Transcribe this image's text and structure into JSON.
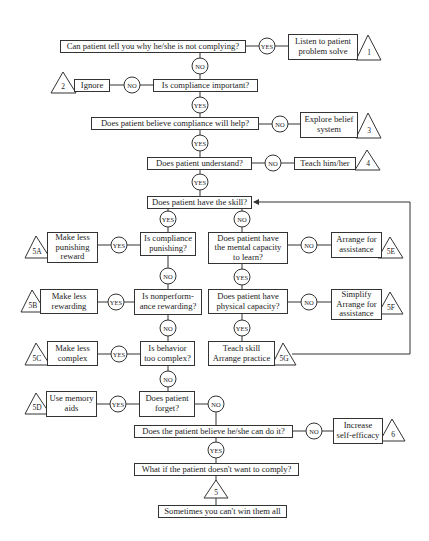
{
  "diagram": {
    "type": "flowchart",
    "decision_labels": {
      "yes": "YES",
      "no": "NO"
    },
    "nodes": {
      "q1": "Can patient tell you why he/she is not complying?",
      "a1": "Listen to patient\nproblem solve",
      "t1": "1",
      "q2": "Is compliance important?",
      "a2": "Ignore",
      "t2": "2",
      "q3": "Does patient believe compliance will help?",
      "a3": "Explore belief\nsystem",
      "t3": "3",
      "q4": "Does patient understand?",
      "a4": "Teach him/her",
      "t4": "4",
      "q5": "Does patient have the skill?",
      "q5a": "Is compliance\npunishing?",
      "a5a": "Make less\npunishing\nreward",
      "t5a": "5A",
      "q5b": "Is nonperform-\nance rewarding?",
      "a5b": "Make less\nrewarding",
      "t5b": "5B",
      "q5c": "Is behavior\ntoo complex?",
      "a5c": "Make less\ncomplex",
      "t5c": "5C",
      "q5d": "Does patient\nforget?",
      "a5d": "Use memory\naids",
      "t5d": "5D",
      "q5e": "Does patient have\nthe mental capacity\nto learn?",
      "a5e": "Arrange for\nassistance",
      "t5e": "5E",
      "q5f": "Does patient have\nphysical capacity?",
      "a5f": "Simplify\nArrange for\nassistance",
      "t5f": "5F",
      "a5g": "Teach skill\nArrange practice",
      "t5g": "5G",
      "q6": "Does the patient believe he/she can do it?",
      "a6": "Increase\nself-efficacy",
      "t6": "6",
      "q7": "What if the patient doesn't want to comply?",
      "t7": "5",
      "end": "Sometimes you can't win them all"
    }
  }
}
